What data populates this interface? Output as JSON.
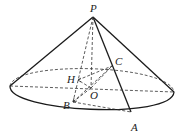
{
  "diagram": {
    "type": "cone",
    "points": {
      "P": {
        "label": "P",
        "x": 93,
        "y": 17,
        "lx": 90,
        "ly": 12
      },
      "O": {
        "label": "O",
        "x": 91,
        "y": 88,
        "lx": 90,
        "ly": 99
      },
      "A": {
        "label": "A",
        "x": 131,
        "y": 112,
        "lx": 131,
        "ly": 131
      },
      "B": {
        "label": "B",
        "x": 73,
        "y": 102,
        "lx": 63,
        "ly": 109
      },
      "C": {
        "label": "C",
        "x": 112,
        "y": 66,
        "lx": 115,
        "ly": 65
      },
      "H": {
        "label": "H",
        "x": 78,
        "y": 80,
        "lx": 67,
        "ly": 83
      }
    },
    "base_ellipse": {
      "cx": 92,
      "cy": 89,
      "rx": 82,
      "ry": 20
    },
    "labels": [
      "P",
      "C",
      "H",
      "O",
      "B",
      "A"
    ]
  }
}
